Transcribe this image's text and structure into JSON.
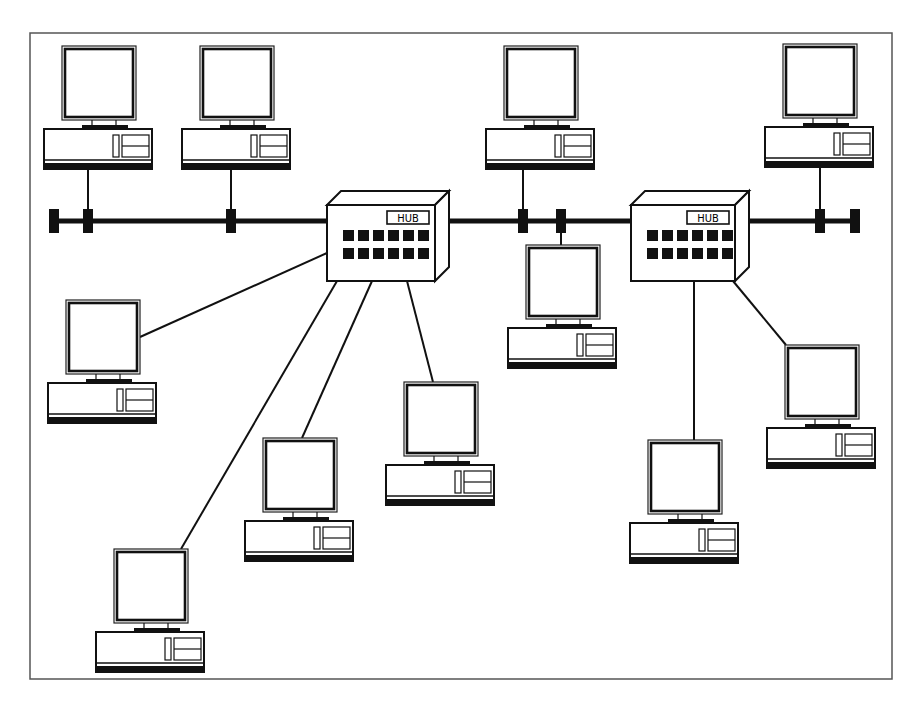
{
  "diagram": {
    "frame": {
      "x": 30,
      "y": 33,
      "w": 862,
      "h": 646
    },
    "bus": {
      "y": 221,
      "x1": 50,
      "x2": 858
    },
    "terminators": [
      {
        "x": 54,
        "y": 221
      },
      {
        "x": 88,
        "y": 221
      },
      {
        "x": 231,
        "y": 221
      },
      {
        "x": 523,
        "y": 221
      },
      {
        "x": 561,
        "y": 221
      },
      {
        "x": 820,
        "y": 221
      },
      {
        "x": 855,
        "y": 221
      }
    ],
    "hubs": [
      {
        "id": "hub-1",
        "label": "HUB",
        "x": 327,
        "y": 205,
        "w": 108,
        "h": 76,
        "depth": 14
      },
      {
        "id": "hub-2",
        "label": "HUB",
        "x": 631,
        "y": 205,
        "w": 104,
        "h": 76,
        "depth": 14
      }
    ],
    "computers": [
      {
        "id": "pc-1",
        "x": 44,
        "y": 46
      },
      {
        "id": "pc-2",
        "x": 182,
        "y": 46
      },
      {
        "id": "pc-3",
        "x": 486,
        "y": 46
      },
      {
        "id": "pc-4",
        "x": 765,
        "y": 44
      },
      {
        "id": "pc-5",
        "x": 508,
        "y": 245
      },
      {
        "id": "pc-6",
        "x": 48,
        "y": 300
      },
      {
        "id": "pc-7",
        "x": 386,
        "y": 382
      },
      {
        "id": "pc-8",
        "x": 245,
        "y": 438
      },
      {
        "id": "pc-9",
        "x": 96,
        "y": 549
      },
      {
        "id": "pc-10",
        "x": 767,
        "y": 345
      },
      {
        "id": "pc-11",
        "x": 630,
        "y": 440
      }
    ],
    "wires": [
      {
        "x1": 88,
        "y1": 168,
        "x2": 88,
        "y2": 221
      },
      {
        "x1": 231,
        "y1": 166,
        "x2": 231,
        "y2": 221
      },
      {
        "x1": 523,
        "y1": 168,
        "x2": 523,
        "y2": 221
      },
      {
        "x1": 820,
        "y1": 166,
        "x2": 820,
        "y2": 221
      },
      {
        "x1": 561,
        "y1": 221,
        "x2": 561,
        "y2": 246
      },
      {
        "x1": 327,
        "y1": 253,
        "x2": 140,
        "y2": 337
      },
      {
        "x1": 337,
        "y1": 281,
        "x2": 181,
        "y2": 549
      },
      {
        "x1": 372,
        "y1": 281,
        "x2": 302,
        "y2": 438
      },
      {
        "x1": 407,
        "y1": 281,
        "x2": 433,
        "y2": 382
      },
      {
        "x1": 694,
        "y1": 281,
        "x2": 694,
        "y2": 440
      },
      {
        "x1": 733,
        "y1": 281,
        "x2": 786,
        "y2": 345
      }
    ]
  }
}
